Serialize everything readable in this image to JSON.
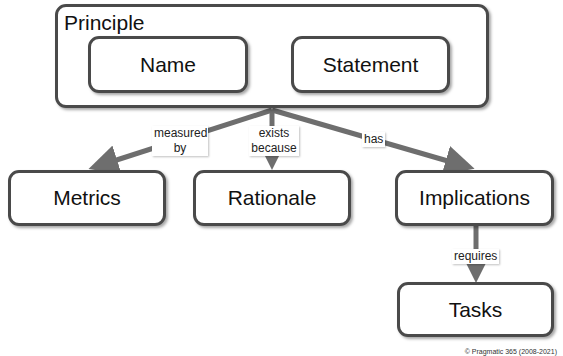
{
  "diagram": {
    "container": {
      "title": "Principle",
      "children": [
        "Name",
        "Statement"
      ]
    },
    "nodes": {
      "name": "Name",
      "statement": "Statement",
      "metrics": "Metrics",
      "rationale": "Rationale",
      "implications": "Implications",
      "tasks": "Tasks"
    },
    "edges": [
      {
        "from": "Principle",
        "to": "Metrics",
        "label": "measured by"
      },
      {
        "from": "Principle",
        "to": "Rationale",
        "label": "exists because"
      },
      {
        "from": "Principle",
        "to": "Implications",
        "label": "has"
      },
      {
        "from": "Implications",
        "to": "Tasks",
        "label": "requires"
      }
    ],
    "edge_labels": {
      "measured_1": "measured",
      "measured_2": "by",
      "exists_1": "exists",
      "exists_2": "because",
      "has": "has",
      "requires": "requires"
    },
    "colors": {
      "border": "#4a4a4a",
      "arrow": "#6e6e6e"
    },
    "copyright": "© Pragmatic 365 (2008-2021)"
  }
}
